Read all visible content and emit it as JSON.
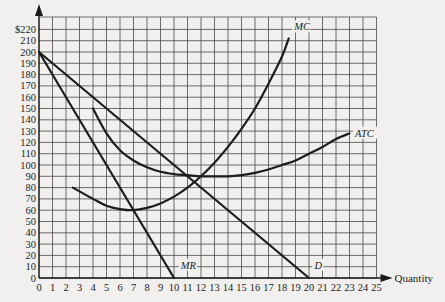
{
  "chart_data": {
    "type": "line",
    "title": "",
    "xlabel": "Quantity",
    "ylabel": "",
    "xlim": [
      0,
      25
    ],
    "ylim": [
      0,
      220
    ],
    "grid": true,
    "x_ticks": [
      "0",
      "1",
      "2",
      "3",
      "4",
      "5",
      "6",
      "7",
      "8",
      "9",
      "10",
      "11",
      "12",
      "13",
      "14",
      "15",
      "16",
      "17",
      "18",
      "19",
      "20",
      "21",
      "22",
      "23",
      "24",
      "25"
    ],
    "y_ticks": [
      "0",
      "10",
      "20",
      "30",
      "40",
      "50",
      "60",
      "70",
      "80",
      "90",
      "100",
      "110",
      "120",
      "130",
      "140",
      "150",
      "160",
      "170",
      "180",
      "190",
      "200",
      "210",
      "$220"
    ],
    "series": [
      {
        "name": "D",
        "label": "D",
        "points": [
          [
            0,
            200
          ],
          [
            20,
            0
          ]
        ]
      },
      {
        "name": "MR",
        "label": "MR",
        "points": [
          [
            0,
            200
          ],
          [
            10,
            0
          ]
        ]
      },
      {
        "name": "MC",
        "label": "MC",
        "points": [
          [
            2.5,
            80
          ],
          [
            4,
            70
          ],
          [
            5,
            64
          ],
          [
            6,
            61
          ],
          [
            7,
            60
          ],
          [
            8,
            62
          ],
          [
            9,
            66
          ],
          [
            10,
            72
          ],
          [
            11,
            80
          ],
          [
            12,
            90
          ],
          [
            13,
            102
          ],
          [
            14,
            116
          ],
          [
            15,
            132
          ],
          [
            16,
            150
          ],
          [
            17,
            172
          ],
          [
            18,
            196
          ],
          [
            18.5,
            212
          ]
        ]
      },
      {
        "name": "ATC",
        "label": "ATC",
        "points": [
          [
            4,
            150
          ],
          [
            5,
            128
          ],
          [
            6,
            113
          ],
          [
            7,
            104
          ],
          [
            8,
            98
          ],
          [
            9,
            94
          ],
          [
            10,
            92
          ],
          [
            11,
            91
          ],
          [
            12,
            90
          ],
          [
            13,
            90
          ],
          [
            14,
            90
          ],
          [
            15,
            91
          ],
          [
            16,
            93
          ],
          [
            17,
            96
          ],
          [
            18,
            100
          ],
          [
            19,
            104
          ],
          [
            20,
            110
          ],
          [
            21,
            116
          ],
          [
            22,
            123
          ],
          [
            23,
            128
          ]
        ]
      }
    ]
  }
}
